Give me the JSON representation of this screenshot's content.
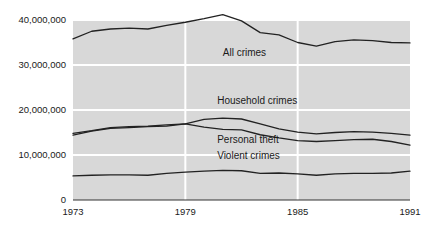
{
  "chart_data": {
    "type": "line",
    "title": "",
    "subtitle": "",
    "xlabel": "",
    "ylabel": "",
    "grid": true,
    "legend_position": "inline-annotations",
    "xlim": [
      1973,
      1991
    ],
    "ylim": [
      0,
      40000000
    ],
    "x": [
      1973,
      1974,
      1975,
      1976,
      1977,
      1978,
      1979,
      1980,
      1981,
      1982,
      1983,
      1984,
      1985,
      1986,
      1987,
      1988,
      1989,
      1990,
      1991
    ],
    "y_ticks": [
      0,
      10000000,
      20000000,
      30000000,
      40000000
    ],
    "y_tick_labels": [
      "0",
      "10,000,000",
      "20,000,000",
      "30,000,000",
      "40,000,000"
    ],
    "x_ticks": [
      1973,
      1979,
      1985,
      1991
    ],
    "x_tick_labels": [
      "1973",
      "1979",
      "1985",
      "1991"
    ],
    "series": [
      {
        "name": "All crimes",
        "label": "All crimes",
        "color": "#222222",
        "values": [
          35800000,
          37500000,
          38000000,
          38200000,
          38000000,
          38800000,
          39500000,
          40300000,
          41200000,
          39800000,
          37200000,
          36700000,
          35000000,
          34200000,
          35200000,
          35600000,
          35400000,
          35000000,
          34900000
        ]
      },
      {
        "name": "Household crimes",
        "label": "Household crimes",
        "color": "#222222",
        "values": [
          14400000,
          15300000,
          15900000,
          16100000,
          16300000,
          16400000,
          16900000,
          17900000,
          18200000,
          18000000,
          16900000,
          15800000,
          15100000,
          14700000,
          15000000,
          15200000,
          15100000,
          14800000,
          14400000
        ]
      },
      {
        "name": "Personal theft",
        "label": "Personal theft",
        "color": "#222222",
        "values": [
          14800000,
          15400000,
          16100000,
          16300000,
          16400000,
          16700000,
          16900000,
          16200000,
          15700000,
          15600000,
          14500000,
          13800000,
          13200000,
          13000000,
          13200000,
          13400000,
          13500000,
          13000000,
          12200000
        ]
      },
      {
        "name": "Violent crimes",
        "label": "Violent crimes",
        "color": "#222222",
        "values": [
          5350000,
          5500000,
          5600000,
          5600000,
          5500000,
          5900000,
          6200000,
          6400000,
          6600000,
          6500000,
          5900000,
          6000000,
          5800000,
          5500000,
          5800000,
          5900000,
          5900000,
          6000000,
          6400000
        ]
      }
    ],
    "annotations": [
      {
        "text": "All crimes",
        "x": 1981.0,
        "y": 31900000
      },
      {
        "text": "Household crimes",
        "x": 1980.7,
        "y": 21300000
      },
      {
        "text": "Personal theft",
        "x": 1980.7,
        "y": 12600000
      },
      {
        "text": "Violent crimes",
        "x": 1980.7,
        "y": 9200000
      }
    ],
    "colors": {
      "plot_background": "#d8d8d8",
      "gridline": "#ffffff",
      "line": "#222222",
      "axis": "#333333",
      "text": "#1a1a1a",
      "page_background": "#ffffff"
    }
  }
}
